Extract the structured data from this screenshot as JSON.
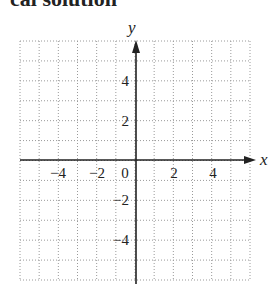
{
  "header": {
    "text": "cal solution"
  },
  "chart_data": {
    "type": "line",
    "title": "",
    "xlabel": "x",
    "ylabel": "y",
    "xlim": [
      -6,
      6
    ],
    "ylim": [
      -6,
      6
    ],
    "grid": true,
    "x_ticks": [
      "-4",
      "-2",
      "0",
      "2",
      "4"
    ],
    "y_ticks": [
      "4",
      "2",
      "-2",
      "-4"
    ],
    "series": []
  },
  "colors": {
    "axis": "#222222",
    "grid": "#999999"
  }
}
